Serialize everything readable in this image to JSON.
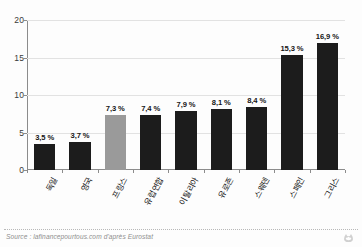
{
  "chart_data": {
    "type": "bar",
    "title": "",
    "xlabel": "",
    "ylabel": "",
    "ylim": [
      0,
      20
    ],
    "yticks": [
      "0",
      "5",
      "10",
      "15",
      "20"
    ],
    "ytick_values": [
      0,
      5,
      10,
      15,
      20
    ],
    "grid": true,
    "legend": null,
    "categories": [
      "독일",
      "영국",
      "프랑스",
      "유럽연합",
      "이탈리아",
      "유로존",
      "스웨덴",
      "스페인",
      "그리스"
    ],
    "values": [
      3.5,
      3.7,
      7.3,
      7.4,
      7.9,
      8.1,
      8.4,
      15.3,
      16.9
    ],
    "data_labels": [
      "3,5 %",
      "3,7 %",
      "7,3 %",
      "7,4 %",
      "7,9 %",
      "8,1 %",
      "8,4 %",
      "15,3 %",
      "16,9 %"
    ],
    "bar_colors": [
      "#1c1c1c",
      "#1c1c1c",
      "#9a9a9a",
      "#1c1c1c",
      "#1c1c1c",
      "#1c1c1c",
      "#1c1c1c",
      "#1c1c1c",
      "#1c1c1c"
    ],
    "highlight_index": 2,
    "highlight_color": "#9a9a9a",
    "default_bar_color": "#1c1c1c"
  },
  "footer": {
    "source": "Source : lafinancepourtous.com d'après Eurostat"
  },
  "icons": {
    "brand": "brand-logo-icon"
  }
}
